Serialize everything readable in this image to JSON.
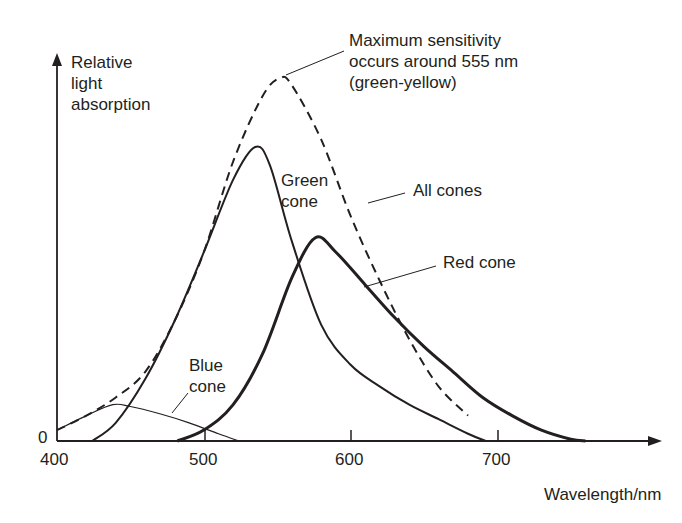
{
  "chart_data": {
    "type": "line",
    "title": "",
    "xlabel": "Wavelength/nm",
    "ylabel": "Relative light absorption",
    "xlim": [
      400,
      790
    ],
    "ylim": [
      0,
      1.05
    ],
    "x_ticks": [
      "400",
      "500",
      "600",
      "700"
    ],
    "y_ticks": [
      "0"
    ],
    "grid": false,
    "legend": "inline annotations",
    "series": [
      {
        "name": "All cones",
        "style": "dashed",
        "x": [
          400,
          420,
          440,
          460,
          480,
          500,
          520,
          540,
          552,
          560,
          580,
          600,
          620,
          640,
          660,
          680
        ],
        "values": [
          0.03,
          0.07,
          0.12,
          0.19,
          0.33,
          0.52,
          0.77,
          0.95,
          1.0,
          0.98,
          0.83,
          0.62,
          0.44,
          0.28,
          0.15,
          0.07
        ]
      },
      {
        "name": "Green cone",
        "style": "solid",
        "x": [
          424,
          440,
          460,
          480,
          500,
          520,
          535,
          545,
          560,
          580,
          600,
          620,
          640,
          660,
          680,
          692
        ],
        "values": [
          0.0,
          0.05,
          0.17,
          0.33,
          0.52,
          0.72,
          0.81,
          0.76,
          0.55,
          0.32,
          0.21,
          0.15,
          0.1,
          0.06,
          0.02,
          0.0
        ]
      },
      {
        "name": "Red cone",
        "style": "solid-bold",
        "x": [
          482,
          500,
          520,
          540,
          560,
          576,
          590,
          610,
          630,
          650,
          670,
          690,
          710,
          730,
          750,
          760
        ],
        "values": [
          0.0,
          0.03,
          0.1,
          0.24,
          0.45,
          0.56,
          0.52,
          0.43,
          0.34,
          0.26,
          0.19,
          0.12,
          0.07,
          0.03,
          0.005,
          0.0
        ]
      },
      {
        "name": "Blue cone",
        "style": "solid-thin",
        "x": [
          400,
          420,
          438,
          450,
          470,
          490,
          510,
          524
        ],
        "values": [
          0.03,
          0.07,
          0.1,
          0.095,
          0.075,
          0.05,
          0.02,
          0.0
        ]
      }
    ],
    "annotations": [
      {
        "text": "Maximum sensitivity occurs around 555 nm (green-yellow)",
        "target_x": 552
      },
      {
        "text": "Green cone"
      },
      {
        "text": "All cones"
      },
      {
        "text": "Red cone"
      },
      {
        "text": "Blue cone"
      }
    ]
  },
  "labels": {
    "ylabel_lines": [
      "Relative",
      "light",
      "absorption"
    ],
    "xlabel": "Wavelength/nm",
    "zero": "0",
    "ticks": [
      "400",
      "500",
      "600",
      "700"
    ],
    "max_note_lines": [
      "Maximum sensitivity",
      "occurs around 555 nm",
      "(green-yellow)"
    ],
    "green_lines": [
      "Green",
      "cone"
    ],
    "all_cones": "All cones",
    "red_cone": "Red cone",
    "blue_lines": [
      "Blue",
      "cone"
    ]
  }
}
